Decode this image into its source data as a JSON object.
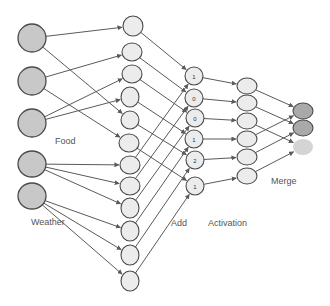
{
  "diagram": {
    "labels": {
      "food": "Food",
      "weather": "Weather",
      "add": "Add",
      "activation": "Activation",
      "merge": "Merge"
    },
    "colors": {
      "input_fill": "#c8c8c8",
      "hidden_fill": "#ececec",
      "merge_fill": "#a9a9a9",
      "merge_faded_fill": "#d4d4d4",
      "stroke": "#4a4a4a",
      "edge": "#5a5a5a"
    },
    "layers": {
      "inputs": [
        {
          "id": "food-1",
          "group": "food",
          "cx": 32,
          "cy": 38,
          "rx": 14,
          "ry": 14
        },
        {
          "id": "food-2",
          "group": "food",
          "cx": 32,
          "cy": 81,
          "rx": 14,
          "ry": 14
        },
        {
          "id": "food-3",
          "group": "food",
          "cx": 32,
          "cy": 123,
          "rx": 14,
          "ry": 14
        },
        {
          "id": "weather-1",
          "group": "weather",
          "cx": 32,
          "cy": 164,
          "rx": 14,
          "ry": 13
        },
        {
          "id": "weather-2",
          "group": "weather",
          "cx": 32,
          "cy": 196,
          "rx": 14,
          "ry": 13
        }
      ],
      "hidden": [
        {
          "id": "h1",
          "cx": 133,
          "cy": 26,
          "rx": 10,
          "ry": 10
        },
        {
          "id": "h2",
          "cx": 132,
          "cy": 52,
          "rx": 10,
          "ry": 9
        },
        {
          "id": "h3",
          "cx": 132,
          "cy": 74,
          "rx": 10,
          "ry": 9
        },
        {
          "id": "h4",
          "cx": 130,
          "cy": 97,
          "rx": 9,
          "ry": 10
        },
        {
          "id": "h5",
          "cx": 130,
          "cy": 120,
          "rx": 9,
          "ry": 9
        },
        {
          "id": "h6",
          "cx": 129,
          "cy": 143,
          "rx": 10,
          "ry": 9
        },
        {
          "id": "h7",
          "cx": 130,
          "cy": 165,
          "rx": 10,
          "ry": 9
        },
        {
          "id": "h8",
          "cx": 130,
          "cy": 186,
          "rx": 10,
          "ry": 9
        },
        {
          "id": "h9",
          "cx": 130,
          "cy": 208,
          "rx": 9,
          "ry": 10
        },
        {
          "id": "h10",
          "cx": 130,
          "cy": 231,
          "rx": 9,
          "ry": 10
        },
        {
          "id": "h11",
          "cx": 130,
          "cy": 255,
          "rx": 9,
          "ry": 10
        },
        {
          "id": "h12",
          "cx": 130,
          "cy": 281,
          "rx": 9,
          "ry": 10
        }
      ],
      "add": [
        {
          "id": "a1",
          "value": "1",
          "cx": 194,
          "cy": 76,
          "rx": 9,
          "ry": 9
        },
        {
          "id": "a2",
          "value": "0",
          "cx": 194,
          "cy": 98,
          "rx": 9,
          "ry": 9
        },
        {
          "id": "a3",
          "value": "0",
          "cx": 195,
          "cy": 118,
          "rx": 9,
          "ry": 9
        },
        {
          "id": "a4",
          "value": "1",
          "cx": 194,
          "cy": 139,
          "rx": 9,
          "ry": 9
        },
        {
          "id": "a5",
          "value": "2",
          "cx": 195,
          "cy": 160,
          "rx": 9,
          "ry": 9
        },
        {
          "id": "a6",
          "value": "1",
          "cx": 195,
          "cy": 186,
          "rx": 9,
          "ry": 9
        }
      ],
      "activation": [
        {
          "id": "act1",
          "cx": 247,
          "cy": 86,
          "rx": 10,
          "ry": 8
        },
        {
          "id": "act2",
          "cx": 247,
          "cy": 103,
          "rx": 10,
          "ry": 8
        },
        {
          "id": "act3",
          "cx": 247,
          "cy": 121,
          "rx": 10,
          "ry": 8
        },
        {
          "id": "act4",
          "cx": 247,
          "cy": 139,
          "rx": 10,
          "ry": 8
        },
        {
          "id": "act5",
          "cx": 247,
          "cy": 157,
          "rx": 10,
          "ry": 8
        },
        {
          "id": "act6",
          "cx": 247,
          "cy": 176,
          "rx": 10,
          "ry": 8
        }
      ],
      "merge": [
        {
          "id": "m1",
          "cx": 303,
          "cy": 111,
          "rx": 10,
          "ry": 8,
          "faded": false
        },
        {
          "id": "m2",
          "cx": 303,
          "cy": 128,
          "rx": 10,
          "ry": 8,
          "faded": false
        },
        {
          "id": "m3",
          "cx": 303,
          "cy": 147,
          "rx": 10,
          "ry": 8,
          "faded": true
        }
      ]
    },
    "edges": [
      [
        "food-1",
        "h1"
      ],
      [
        "food-1",
        "h5"
      ],
      [
        "food-2",
        "h2"
      ],
      [
        "food-2",
        "h6"
      ],
      [
        "food-3",
        "h3"
      ],
      [
        "food-3",
        "h4"
      ],
      [
        "weather-1",
        "h7"
      ],
      [
        "weather-1",
        "h8"
      ],
      [
        "weather-1",
        "h9"
      ],
      [
        "weather-2",
        "h10"
      ],
      [
        "weather-2",
        "h11"
      ],
      [
        "weather-2",
        "h12"
      ],
      [
        "h1",
        "a1"
      ],
      [
        "h2",
        "a2"
      ],
      [
        "h3",
        "a3"
      ],
      [
        "h4",
        "a4"
      ],
      [
        "h5",
        "a5"
      ],
      [
        "h6",
        "a6"
      ],
      [
        "h7",
        "a1"
      ],
      [
        "h8",
        "a2"
      ],
      [
        "h9",
        "a3"
      ],
      [
        "h10",
        "a4"
      ],
      [
        "h11",
        "a5"
      ],
      [
        "h12",
        "a6"
      ],
      [
        "a1",
        "act1"
      ],
      [
        "a2",
        "act2"
      ],
      [
        "a3",
        "act3"
      ],
      [
        "a4",
        "act4"
      ],
      [
        "a5",
        "act5"
      ],
      [
        "a6",
        "act6"
      ],
      [
        "act1",
        "m1"
      ],
      [
        "act2",
        "m2"
      ],
      [
        "act3",
        "m3"
      ],
      [
        "act4",
        "m1"
      ],
      [
        "act5",
        "m2"
      ],
      [
        "act6",
        "m3"
      ]
    ]
  }
}
